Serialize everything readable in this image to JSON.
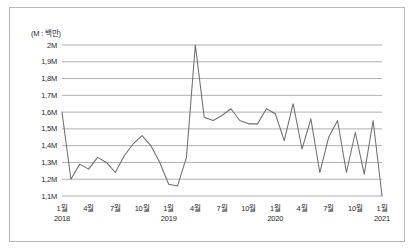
{
  "figure": {
    "unit_note": "(M : 백만)",
    "border_color": "#b9b9b9",
    "background": "#ffffff"
  },
  "chart_data": {
    "type": "line",
    "title": "",
    "subtitle": "",
    "xlabel": "",
    "ylabel": "",
    "unit_note": "(M : 백만)",
    "grid": true,
    "legend": false,
    "legend_position": "none",
    "line_color": "#6f6f6f",
    "grid_color": "#8e8e8e",
    "ylim": [
      1.1,
      2.0
    ],
    "ytick_values": [
      2.0,
      1.9,
      1.8,
      1.7,
      1.6,
      1.5,
      1.4,
      1.3,
      1.2,
      1.1
    ],
    "ytick_labels": [
      "2M",
      "1,9M",
      "1,8M",
      "1,7M",
      "1,6M",
      "1,5M",
      "1,4M",
      "1,3M",
      "1,2M",
      "1,1M"
    ],
    "xtick_labels": [
      "1월",
      "4월",
      "7월",
      "10월",
      "1월",
      "4월",
      "7월",
      "10월",
      "1월",
      "4월",
      "7월",
      "10월",
      "1월"
    ],
    "xtick_year_labels": [
      "2018",
      "",
      "",
      "",
      "2019",
      "",
      "",
      "",
      "2020",
      "",
      "",
      "",
      "2021"
    ],
    "xtick_indices": [
      0,
      3,
      6,
      9,
      12,
      15,
      18,
      21,
      24,
      27,
      30,
      33,
      36
    ],
    "x": [
      "2018-01",
      "2018-02",
      "2018-03",
      "2018-04",
      "2018-05",
      "2018-06",
      "2018-07",
      "2018-08",
      "2018-09",
      "2018-10",
      "2018-11",
      "2018-12",
      "2019-01",
      "2019-02",
      "2019-03",
      "2019-04",
      "2019-05",
      "2019-06",
      "2019-07",
      "2019-08",
      "2019-09",
      "2019-10",
      "2019-11",
      "2019-12",
      "2020-01",
      "2020-02",
      "2020-03",
      "2020-04",
      "2020-05",
      "2020-06",
      "2020-07",
      "2020-08",
      "2020-09",
      "2020-10",
      "2020-11",
      "2020-12",
      "2021-01"
    ],
    "values": [
      1.6,
      1.2,
      1.29,
      1.26,
      1.33,
      1.3,
      1.24,
      1.34,
      1.41,
      1.46,
      1.4,
      1.3,
      1.17,
      1.16,
      1.33,
      2.0,
      1.57,
      1.55,
      1.58,
      1.62,
      1.55,
      1.53,
      1.53,
      1.62,
      1.59,
      1.43,
      1.65,
      1.38,
      1.56,
      1.24,
      1.45,
      1.55,
      1.24,
      1.48,
      1.23,
      1.55,
      1.1
    ]
  }
}
